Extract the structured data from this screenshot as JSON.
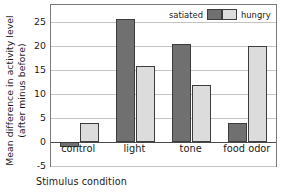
{
  "chart_data": {
    "type": "bar",
    "title": "",
    "subtitle": "",
    "xlabel": "Stimulus condition",
    "ylabel": "Mean difference in activity level (after minus before)",
    "ylabel_lines": [
      "Mean difference in activity level",
      "(after minus before)"
    ],
    "categories": [
      "control",
      "light",
      "tone",
      "food odor"
    ],
    "series": [
      {
        "name": "satiated",
        "color": "#707070",
        "values": [
          -1,
          25.5,
          20.3,
          4
        ]
      },
      {
        "name": "hungry",
        "color": "#dcdcdc",
        "values": [
          4,
          15.8,
          11.8,
          20
        ]
      }
    ],
    "ylim": [
      -5,
      28.5
    ],
    "yticks": [
      25,
      20,
      15,
      10,
      5,
      0,
      -5
    ],
    "ytick_labels": [
      "25",
      "20",
      "15",
      "10",
      "5",
      "0",
      "-5"
    ],
    "grid": true,
    "grid_axis": "y",
    "legend_position": "top-right-inside",
    "legend_entries": [
      "satiated",
      "hungry"
    ],
    "zero_line": 0
  },
  "colors": {
    "satiated": "#707070",
    "hungry": "#dcdcdc",
    "gridline": "#c3c3c3",
    "axis": "#7a7a7a",
    "zero_line": "#4a4a4a",
    "text": "#1a1a1a",
    "background": "#ffffff"
  }
}
